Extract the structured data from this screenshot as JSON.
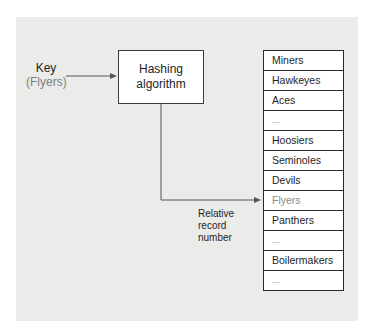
{
  "diagram": {
    "key": {
      "label": "Key",
      "value": "(Flyers)"
    },
    "hash_box": {
      "line1": "Hashing",
      "line2": "algorithm"
    },
    "relative_label": {
      "line1": "Relative",
      "line2": "record",
      "line3": "number"
    },
    "records": [
      {
        "label": "Miners",
        "highlight": false
      },
      {
        "label": "Hawkeyes",
        "highlight": false
      },
      {
        "label": "Aces",
        "highlight": false
      },
      {
        "label": "...",
        "highlight": false
      },
      {
        "label": "Hoosiers",
        "highlight": false
      },
      {
        "label": "Seminoles",
        "highlight": false
      },
      {
        "label": "Devils",
        "highlight": false
      },
      {
        "label": "Flyers",
        "highlight": true
      },
      {
        "label": "Panthers",
        "highlight": false
      },
      {
        "label": "...",
        "highlight": false
      },
      {
        "label": "Boilermakers",
        "highlight": false
      },
      {
        "label": "...",
        "highlight": false
      }
    ],
    "colors": {
      "panel": "#ebebe9",
      "line": "#555555",
      "highlight_text": "#8a8a8a"
    }
  }
}
